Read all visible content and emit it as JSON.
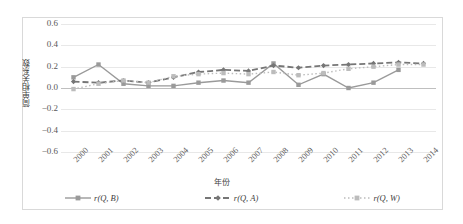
{
  "chart_data": {
    "type": "line",
    "title": "",
    "xlabel": "年份",
    "ylabel": "简单相关系数",
    "categories": [
      "2000",
      "2001",
      "2002",
      "2003",
      "2004",
      "2005",
      "2006",
      "2007",
      "2008",
      "2009",
      "2010",
      "2011",
      "2012",
      "2013",
      "2014"
    ],
    "ylim": [
      -0.6,
      0.6
    ],
    "yticks": [
      "0.6",
      "0.4",
      "0.2",
      "0.0",
      "-0.2",
      "-0.4",
      "-0.6"
    ],
    "ytick_values": [
      0.6,
      0.4,
      0.2,
      0.0,
      -0.2,
      -0.4,
      -0.6
    ],
    "grid": true,
    "legend_position": "bottom",
    "series": [
      {
        "name": "r(Q, B)",
        "style": "solid",
        "marker": "square",
        "color": "#9a9a9a",
        "values": [
          0.1,
          0.22,
          0.04,
          0.02,
          0.02,
          0.05,
          0.07,
          0.05,
          0.23,
          0.03,
          0.13,
          0.0,
          0.05,
          0.17,
          null
        ]
      },
      {
        "name": "r(Q, A)",
        "style": "dashed",
        "marker": "diamond",
        "color": "#767676",
        "values": [
          0.06,
          0.05,
          0.07,
          0.05,
          0.1,
          0.15,
          0.17,
          0.16,
          0.21,
          0.19,
          0.21,
          0.22,
          0.23,
          0.24,
          0.23
        ]
      },
      {
        "name": "r(Q, W)",
        "style": "dotted",
        "marker": "square-light",
        "color": "#bcbcbc",
        "values": [
          -0.01,
          0.04,
          0.07,
          0.05,
          0.11,
          0.13,
          0.14,
          0.13,
          0.15,
          0.12,
          0.14,
          0.18,
          0.2,
          0.22,
          0.22
        ]
      }
    ]
  },
  "legend": {
    "items": [
      {
        "label_prefix": "r",
        "label_body": "(Q, B)"
      },
      {
        "label_prefix": "r",
        "label_body": "(Q, A)"
      },
      {
        "label_prefix": "r",
        "label_body": "(Q, W)"
      }
    ]
  }
}
